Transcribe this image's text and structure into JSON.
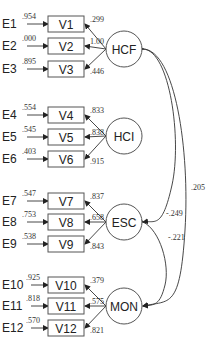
{
  "diagram": {
    "type": "structural-equation-model",
    "factors": [
      {
        "id": "HCF",
        "label": "HCF",
        "cx": 124,
        "cy": 49
      },
      {
        "id": "HCI",
        "label": "HCI",
        "cx": 124,
        "cy": 136
      },
      {
        "id": "ESC",
        "label": "ESC",
        "cx": 124,
        "cy": 222
      },
      {
        "id": "MON",
        "label": "MON",
        "cx": 124,
        "cy": 306
      }
    ],
    "indicators": [
      {
        "label": "V1",
        "y": 24,
        "error": "E1",
        "error_var": ".954",
        "loading": ".299",
        "factor": "HCF"
      },
      {
        "label": "V2",
        "y": 46,
        "error": "E2",
        "error_var": ".000",
        "loading": "1.00",
        "factor": "HCF"
      },
      {
        "label": "V3",
        "y": 69,
        "error": "E3",
        "error_var": ".895",
        "loading": ".446",
        "factor": "HCF"
      },
      {
        "label": "V4",
        "y": 115,
        "error": "E4",
        "error_var": ".554",
        "loading": ".833",
        "factor": "HCI"
      },
      {
        "label": "V5",
        "y": 137,
        "error": "E5",
        "error_var": ".545",
        "loading": ".838",
        "factor": "HCI"
      },
      {
        "label": "V6",
        "y": 159,
        "error": "E6",
        "error_var": ".403",
        "loading": ".915",
        "factor": "HCI"
      },
      {
        "label": "V7",
        "y": 201,
        "error": "E7",
        "error_var": ".547",
        "loading": ".837",
        "factor": "ESC"
      },
      {
        "label": "V8",
        "y": 222,
        "error": "E8",
        "error_var": ".753",
        "loading": ".658",
        "factor": "ESC"
      },
      {
        "label": "V9",
        "y": 244,
        "error": "E9",
        "error_var": ".538",
        "loading": ".843",
        "factor": "ESC"
      },
      {
        "label": "V10",
        "y": 285,
        "error": "E10",
        "error_var": ".925",
        "loading": ".379",
        "factor": "MON"
      },
      {
        "label": "V11",
        "y": 306,
        "error": "E11",
        "error_var": ".818",
        "loading": ".575",
        "factor": "MON"
      },
      {
        "label": "V12",
        "y": 328,
        "error": "E12",
        "error_var": ".570",
        "loading": ".821",
        "factor": "MON"
      }
    ],
    "covariances": [
      {
        "from": "HCF",
        "to": "MON",
        "value": ".205"
      },
      {
        "from": "HCF",
        "to": "ESC",
        "value": "-.249"
      },
      {
        "from": "ESC",
        "to": "MON",
        "value": "-.221"
      }
    ]
  }
}
